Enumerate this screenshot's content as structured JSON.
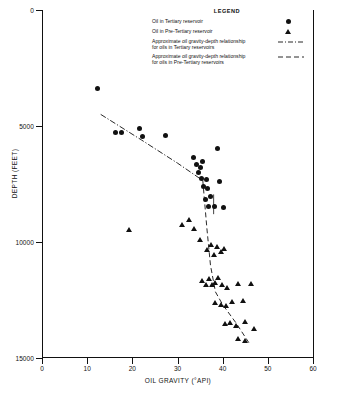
{
  "chart_data": {
    "type": "scatter",
    "title": "",
    "xlabel": "OIL GRAVITY (°API)",
    "ylabel": "DEPTH (FEET)",
    "xlim": [
      0,
      60
    ],
    "ylim": [
      15000,
      0
    ],
    "y_inverted": true,
    "grid": false,
    "xticks": [
      0,
      10,
      20,
      30,
      40,
      50,
      60
    ],
    "xtick_labels": [
      "0",
      "10",
      "20",
      "30",
      "40",
      "50",
      "60"
    ],
    "yticks": [
      0,
      5000,
      10000,
      15000
    ],
    "ytick_labels": [
      "0",
      "5000",
      "10000",
      "15000"
    ],
    "legend": {
      "title": "LEGEND",
      "position": "top-right-inside",
      "entries": [
        {
          "label": "Oil in Tertiary reservoir",
          "marker": "circle"
        },
        {
          "label": "Oil in Pre-Tertiary reservoir",
          "marker": "triangle"
        },
        {
          "label": "Approximate oil gravity-depth relationship\nfor oils in Tertiary reservoirs",
          "marker": "dash-dot-line"
        },
        {
          "label": "Approximate oil gravity-depth relationship\nfor oils in Pre-Tertiary reservoirs",
          "marker": "dashed-line"
        }
      ]
    },
    "series": [
      {
        "name": "Oil in Tertiary reservoir",
        "marker": "circle",
        "points": [
          [
            12.2,
            3400
          ],
          [
            16.3,
            5300
          ],
          [
            17.6,
            5300
          ],
          [
            21.5,
            5100
          ],
          [
            22.2,
            5450
          ],
          [
            27.4,
            5400
          ],
          [
            33.6,
            6350
          ],
          [
            34.3,
            6650
          ],
          [
            34.6,
            7000
          ],
          [
            35.1,
            6800
          ],
          [
            35.3,
            7250
          ],
          [
            35.6,
            6550
          ],
          [
            35.8,
            7600
          ],
          [
            36.4,
            7300
          ],
          [
            36.7,
            7700
          ],
          [
            36.3,
            8150
          ],
          [
            36.9,
            8450
          ],
          [
            37.4,
            8050
          ],
          [
            38.1,
            8450
          ],
          [
            38.9,
            5950
          ],
          [
            39.3,
            7400
          ],
          [
            40.2,
            8500
          ]
        ]
      },
      {
        "name": "Oil in Pre-Tertiary reservoir",
        "marker": "triangle",
        "points": [
          [
            19.4,
            9500
          ],
          [
            31.0,
            9250
          ],
          [
            32.5,
            9050
          ],
          [
            33.6,
            9450
          ],
          [
            35.0,
            9900
          ],
          [
            36.6,
            10350
          ],
          [
            37.4,
            10150
          ],
          [
            38.1,
            10550
          ],
          [
            38.8,
            10200
          ],
          [
            39.6,
            10450
          ],
          [
            40.4,
            10300
          ],
          [
            35.5,
            11700
          ],
          [
            36.3,
            11850
          ],
          [
            37.0,
            11600
          ],
          [
            37.6,
            11850
          ],
          [
            38.4,
            11750
          ],
          [
            39.1,
            11550
          ],
          [
            40.0,
            11850
          ],
          [
            41.1,
            12000
          ],
          [
            43.5,
            11800
          ],
          [
            46.4,
            11800
          ],
          [
            38.4,
            12650
          ],
          [
            39.6,
            12700
          ],
          [
            40.8,
            12750
          ],
          [
            42.0,
            12600
          ],
          [
            44.5,
            12550
          ],
          [
            40.5,
            13550
          ],
          [
            41.6,
            13500
          ],
          [
            43.0,
            13600
          ],
          [
            45.0,
            13450
          ],
          [
            47.0,
            13750
          ],
          [
            43.5,
            14200
          ],
          [
            45.0,
            14250
          ]
        ]
      }
    ],
    "trend_lines": [
      {
        "name": "Approximate oil gravity-depth relationship for oils in Tertiary reservoirs",
        "style": "dash-dot",
        "points": [
          [
            13.0,
            4500
          ],
          [
            22.0,
            5600
          ],
          [
            30.0,
            6600
          ],
          [
            35.6,
            7350
          ]
        ]
      },
      {
        "name": "Approximate oil gravity-depth relationship for oils in Pre-Tertiary reservoirs",
        "style": "dashed",
        "points": [
          [
            35.6,
            7350
          ],
          [
            36.5,
            9400
          ],
          [
            37.3,
            11000
          ],
          [
            38.4,
            12150
          ],
          [
            40.0,
            12700
          ],
          [
            43.0,
            13500
          ],
          [
            46.0,
            14400
          ]
        ]
      }
    ],
    "annotations": [
      {
        "type": "error-bar",
        "x": 38.0,
        "y_top": 7950,
        "y_bottom": 8800
      }
    ]
  }
}
